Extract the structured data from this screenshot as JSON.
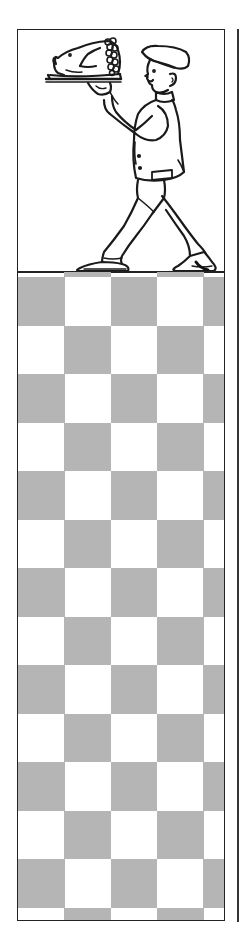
{
  "artwork": {
    "subject": "waiter carrying roast pig on platter",
    "style": "vintage line-art clip-art border"
  },
  "colors": {
    "ink": "#222222",
    "checker_dark": "#b5b5b5",
    "checker_light": "#ffffff",
    "background": "#ffffff"
  },
  "checkerboard": {
    "columns": 5,
    "column_width": 46.3,
    "row_height": 48.5,
    "first_full_row_top": 5,
    "rows": 14
  }
}
